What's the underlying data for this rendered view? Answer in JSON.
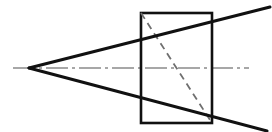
{
  "figure": {
    "domain": "Diagram",
    "canvas": {
      "width": 272,
      "height": 132,
      "background_color": "#ffffff"
    },
    "colors": {
      "stroke": "#111111",
      "centerline": "#8a8a8a",
      "hidden_edge": "#6f6f6f",
      "background": "#ffffff"
    },
    "strokes": {
      "solid_width": 3.0,
      "rectangle_width": 2.6,
      "dashed_width": 1.8,
      "centerline_width": 1.4,
      "dash_pattern": "7 5",
      "centerline_pattern": "22 4 3 4"
    },
    "points": {
      "apex": {
        "label": "apex",
        "x": 29,
        "y": 68
      },
      "rect_top_left": {
        "label": "rect-top-left",
        "x": 141,
        "y": 13
      },
      "rect_top_right": {
        "label": "rect-top-right",
        "x": 212,
        "y": 13
      },
      "rect_bottom_right": {
        "label": "rect-bottom-right",
        "x": 212,
        "y": 123
      },
      "rect_bottom_left": {
        "label": "rect-bottom-left",
        "x": 141,
        "y": 123
      },
      "upper_ray_end": {
        "label": "upper-ray-end",
        "x": 270,
        "y": 7
      },
      "lower_ray_end": {
        "label": "lower-ray-end",
        "x": 267,
        "y": 131
      },
      "axis_left": {
        "label": "axis-left",
        "x": 13,
        "y": 68
      },
      "axis_right": {
        "label": "axis-right",
        "x": 249,
        "y": 68
      }
    },
    "elements": {
      "upper_ray": {
        "name": "upper-generatrix-line",
        "kind": "line",
        "style": "solid",
        "path": "M 29 68 L 270 7"
      },
      "lower_ray": {
        "name": "lower-generatrix-line",
        "kind": "line",
        "style": "solid",
        "path": "M 29 68 L 267 131"
      },
      "rectangle": {
        "name": "rectangle-outline",
        "kind": "rect",
        "style": "solid",
        "x": 141,
        "y": 13,
        "width": 71,
        "height": 110
      },
      "hidden_diagonal": {
        "name": "hidden-diagonal-line",
        "kind": "line",
        "style": "dashed",
        "path": "M 141 13 L 212 123"
      },
      "centerline": {
        "name": "axis-centerline",
        "kind": "line",
        "style": "dash-dot",
        "path": "M 13 68 L 249 68"
      }
    }
  }
}
